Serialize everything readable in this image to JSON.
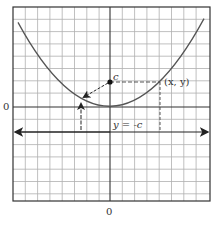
{
  "figure": {
    "type": "parabola-focus-directrix",
    "x_axis_label": "0",
    "y_axis_label": "0",
    "focus_label": "c",
    "point_label": "(x, y)",
    "directrix_label": "y = -c"
  },
  "colors": {
    "grid": "#b0b0b0",
    "axis": "#333333",
    "curve": "#555555",
    "frame": "#333333"
  }
}
